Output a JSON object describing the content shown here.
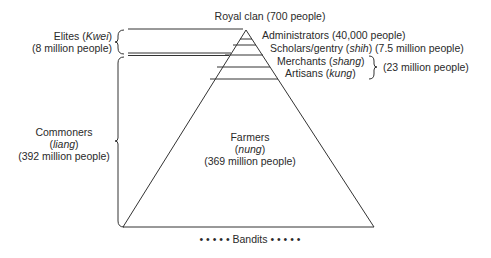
{
  "labels": {
    "royal": "Royal clan (700 people)",
    "administrators": "Administrators (40,000 people)",
    "scholars_a": "Scholars/gentry (",
    "scholars_i": "shih",
    "scholars_b": ") (7.5 million people)",
    "merchants_a": "Merchants (",
    "merchants_i": "shang",
    "merchants_b": ")",
    "artisans_a": "Artisans (",
    "artisans_i": "kung",
    "artisans_b": ")",
    "merchants_artisans_total": "(23 million people)",
    "elites_a": "Elites (",
    "elites_i": "Kwei",
    "elites_b": ")",
    "elites_count": "(8 million people)",
    "commoners": "Commoners",
    "commoners_i": "liang",
    "commoners_count": "(392 million people)",
    "farmers": "Farmers",
    "farmers_i": "nung",
    "farmers_count": "(369 million people)",
    "bandits": "• • • • • Bandits • • • • •"
  },
  "colors": {
    "line": "#333333",
    "text": "#2a2a2a",
    "background": "#ffffff"
  }
}
